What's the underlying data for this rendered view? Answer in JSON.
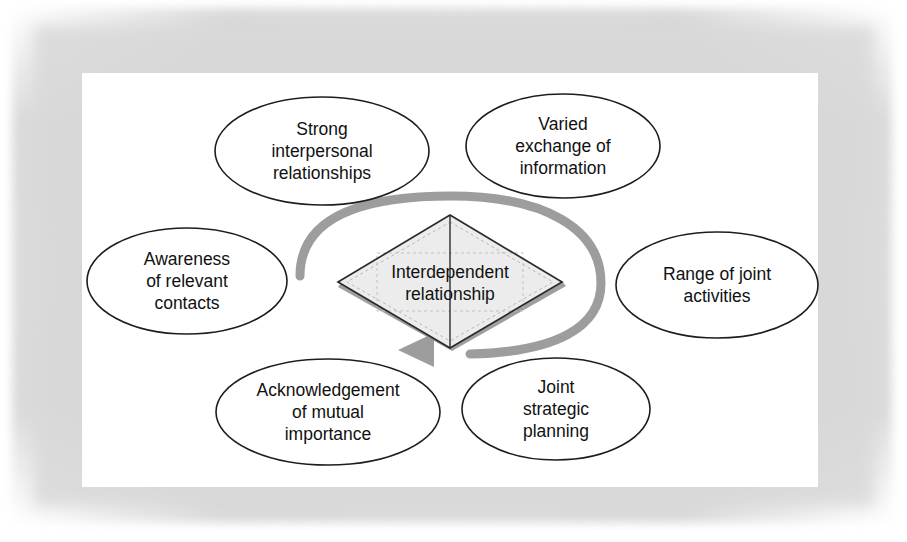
{
  "diagram": {
    "center": {
      "shape": "diamond",
      "label_line1": "Interdependent",
      "label_line2": "relationship",
      "fill_color": "#ececec",
      "border_color": "#2b2b2b"
    },
    "cycle_arrow": {
      "name": "clockwise-cycle-arrow",
      "color": "#9d9d9d",
      "direction": "clockwise"
    },
    "nodes": [
      {
        "id": "strong-interpersonal-relationships",
        "lines": [
          "Strong",
          "interpersonal",
          "relationships"
        ],
        "cx": 322,
        "cy": 151,
        "rx": 107,
        "ry": 54
      },
      {
        "id": "varied-exchange-of-information",
        "lines": [
          "Varied",
          "exchange of",
          "information"
        ],
        "cx": 563,
        "cy": 146,
        "rx": 97,
        "ry": 52
      },
      {
        "id": "awareness-of-relevant-contacts",
        "lines": [
          "Awareness",
          "of relevant",
          "contacts"
        ],
        "cx": 187,
        "cy": 281,
        "rx": 100,
        "ry": 53
      },
      {
        "id": "range-of-joint-activities",
        "lines": [
          "Range of joint",
          "activities"
        ],
        "cx": 717,
        "cy": 285,
        "rx": 101,
        "ry": 53
      },
      {
        "id": "acknowledgement-of-mutual-importance",
        "lines": [
          "Acknowledgement",
          "of mutual",
          "importance"
        ],
        "cx": 328,
        "cy": 412,
        "rx": 112,
        "ry": 53
      },
      {
        "id": "joint-strategic-planning",
        "lines": [
          "Joint",
          "strategic",
          "planning"
        ],
        "cx": 556,
        "cy": 409,
        "rx": 94,
        "ry": 51
      }
    ]
  }
}
